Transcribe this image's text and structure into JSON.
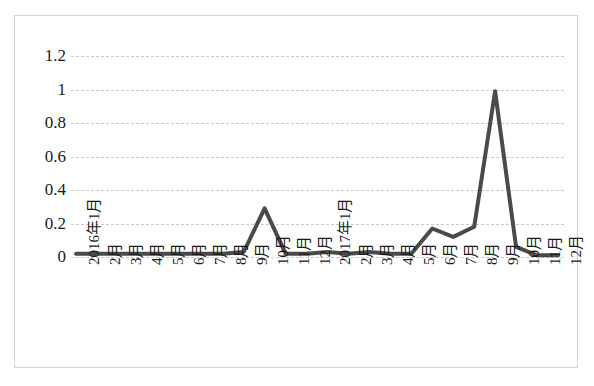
{
  "chart_data": {
    "type": "line",
    "title": "",
    "xlabel": "",
    "ylabel": "",
    "ylim": [
      0,
      1.2
    ],
    "grid": true,
    "legend": "none",
    "line_color": "#4a4a4a",
    "gridline_color": "#c9c9c9",
    "border_color": "#d2d2d2",
    "y_ticks": [
      "0",
      "0.2",
      "0.4",
      "0.6",
      "0.8",
      "1",
      "1.2"
    ],
    "y_tick_values": [
      0,
      0.2,
      0.4,
      0.6,
      0.8,
      1.0,
      1.2
    ],
    "categories": [
      "2016年1月",
      "2月",
      "3月",
      "4月",
      "5月",
      "6月",
      "7月",
      "8月",
      "9月",
      "10月",
      "11月",
      "12月",
      "2017年1月",
      "2月",
      "3月",
      "4月",
      "5月",
      "6月",
      "7月",
      "8月",
      "9月",
      "10月",
      "11月",
      "12月"
    ],
    "series": [
      {
        "name": "",
        "values": [
          0.02,
          0.02,
          0.02,
          0.02,
          0.02,
          0.02,
          0.02,
          0.02,
          0.03,
          0.29,
          0.02,
          0.02,
          0.03,
          0.02,
          0.03,
          0.02,
          0.02,
          0.17,
          0.12,
          0.18,
          0.99,
          0.06,
          0.01,
          0.01
        ]
      }
    ]
  }
}
